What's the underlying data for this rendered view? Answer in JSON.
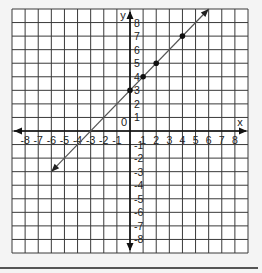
{
  "chart_data": {
    "type": "line",
    "title": "",
    "xlabel": "x",
    "ylabel": "y",
    "origin_label": "0",
    "xlim": [
      -9,
      9
    ],
    "ylim": [
      -9,
      9
    ],
    "grid": true,
    "x_ticks": [
      -8,
      -7,
      -6,
      -5,
      -4,
      -3,
      -2,
      -1,
      1,
      2,
      3,
      4,
      5,
      6,
      7,
      8
    ],
    "y_ticks": [
      8,
      7,
      6,
      5,
      4,
      3,
      2,
      1,
      -1,
      -2,
      -3,
      -4,
      -5,
      -6,
      -7,
      -8
    ],
    "x_tick_labels": [
      "-8",
      "-7",
      "-6",
      "-5",
      "-4",
      "-3",
      "-2",
      "-1",
      "1",
      "2",
      "3",
      "4",
      "5",
      "6",
      "7",
      "8"
    ],
    "y_tick_labels": [
      "8",
      "7",
      "6",
      "5",
      "4",
      "3",
      "2",
      "1",
      "-1",
      "-2",
      "-3",
      "-4",
      "-5",
      "-6",
      "-7",
      "-8"
    ],
    "series": [
      {
        "name": "line",
        "equation": "y = x + 3",
        "line_from": [
          -6,
          -3
        ],
        "line_to": [
          6,
          9
        ],
        "arrows_both_ends": true,
        "points": [
          [
            0,
            3
          ],
          [
            1,
            4
          ],
          [
            2,
            5
          ],
          [
            4,
            7
          ]
        ]
      }
    ],
    "colors": {
      "grid": "#3a3a3a",
      "line": "#555555",
      "point": "#111111",
      "background": "#ffffff",
      "frame": "#f4f4f4"
    }
  }
}
